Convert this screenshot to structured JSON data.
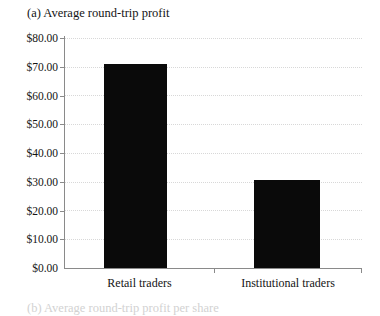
{
  "figure": {
    "panel_label": "(a)",
    "title": "(a) Average round-trip profit",
    "clipped_next_caption": "(b) Average round-trip profit per share"
  },
  "chart_data": {
    "type": "bar",
    "title": "(a) Average round-trip profit",
    "xlabel": "",
    "ylabel": "",
    "categories": [
      "Retail traders",
      "Institutional traders"
    ],
    "values": [
      71.0,
      30.7
    ],
    "value_labels": [
      "$71.00",
      "$30.70"
    ],
    "ylim": [
      0,
      80
    ],
    "ytick_step": 10,
    "ytick_labels": [
      "$80.00",
      "$70.00",
      "$60.00",
      "$50.00",
      "$40.00",
      "$30.00",
      "$20.00",
      "$10.00",
      "$0.00"
    ],
    "ytick_values": [
      80,
      70,
      60,
      50,
      40,
      30,
      20,
      10,
      0
    ],
    "grid": true,
    "grid_style": "dotted",
    "legend": false,
    "bar_color": "#0a0a0a",
    "grid_color": "#d8d8d8",
    "axis_color": "#8a8a8a"
  }
}
